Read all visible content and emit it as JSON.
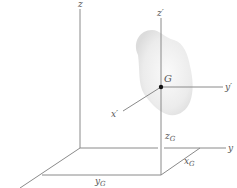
{
  "diagram": {
    "type": "3d-coordinate-frame",
    "colors": {
      "axis": "#8a8a8a",
      "body_fill": "#e8e8e8",
      "label": "#555555",
      "point": "#111111"
    },
    "labels": {
      "z": "z",
      "y": "y",
      "z_prime": "z′",
      "y_prime": "y′",
      "x_prime": "x′",
      "G": "G",
      "zG_main": "z",
      "zG_sub": "G",
      "xG_main": "x",
      "xG_sub": "G",
      "yG_main": "y",
      "yG_sub": "G"
    }
  }
}
